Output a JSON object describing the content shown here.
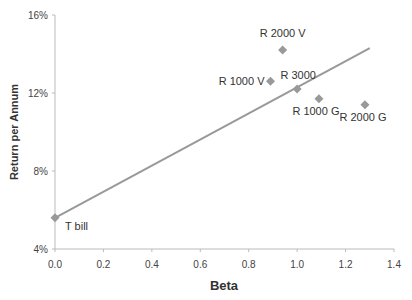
{
  "chart_data": {
    "type": "scatter",
    "title": "",
    "xlabel": "Beta",
    "ylabel": "Return per Annum",
    "xlim": [
      0.0,
      1.4
    ],
    "ylim": [
      4,
      16
    ],
    "x_ticks": [
      "0.0",
      "0.2",
      "0.4",
      "0.6",
      "0.8",
      "1.0",
      "1.2",
      "1.4"
    ],
    "y_ticks": [
      "4%",
      "8%",
      "12%",
      "16%"
    ],
    "grid": false,
    "legend": "none",
    "series": [
      {
        "name": "Portfolios",
        "marker": "diamond",
        "color": "#999999",
        "points": [
          {
            "label": "T bill",
            "x": 0.0,
            "y": 5.6
          },
          {
            "label": "R 2000 V",
            "x": 0.94,
            "y": 14.2
          },
          {
            "label": "R 1000 V",
            "x": 0.89,
            "y": 12.6
          },
          {
            "label": "R 3000",
            "x": 1.0,
            "y": 12.2
          },
          {
            "label": "R 1000 G",
            "x": 1.09,
            "y": 11.7
          },
          {
            "label": "R 2000 G",
            "x": 1.28,
            "y": 11.4
          }
        ]
      },
      {
        "name": "Security Market Line",
        "type": "line",
        "color": "#999999",
        "points": [
          {
            "x": 0.0,
            "y": 5.6
          },
          {
            "x": 1.3,
            "y": 14.3
          }
        ]
      }
    ]
  },
  "labels": {
    "xlabel": "Beta",
    "ylabel": "Return per Annum"
  }
}
